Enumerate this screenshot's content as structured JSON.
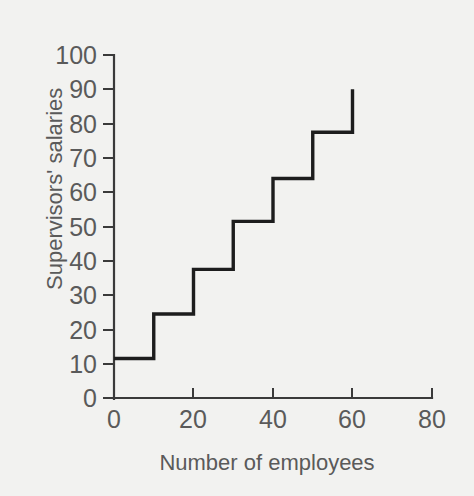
{
  "chart_data": {
    "type": "line",
    "subtype": "step",
    "title": "",
    "xlabel": "Number of employees",
    "ylabel": "Supervisors' salaries",
    "xlim": [
      0,
      80
    ],
    "ylim": [
      0,
      100
    ],
    "xticks": [
      0,
      20,
      40,
      60,
      80
    ],
    "xtick_labels": [
      "0",
      "20",
      "40",
      "60",
      "80"
    ],
    "yticks": [
      0,
      10,
      20,
      30,
      40,
      50,
      60,
      70,
      80,
      90,
      100
    ],
    "ytick_labels": [
      "0",
      "10",
      "20",
      "30",
      "40",
      "50",
      "60",
      "70",
      "80",
      "90",
      "100"
    ],
    "grid": false,
    "legend": null,
    "line_color": "#1d1d1d",
    "background_color": "#f2f2f0",
    "axis_color": "#3a3a3a",
    "text_color": "#5a5a5a",
    "steps": [
      {
        "x_start": 0,
        "x_end": 10,
        "y": 11.5
      },
      {
        "x_start": 10,
        "x_end": 20,
        "y": 24.5
      },
      {
        "x_start": 20,
        "x_end": 30,
        "y": 37.5
      },
      {
        "x_start": 30,
        "x_end": 40,
        "y": 51.5
      },
      {
        "x_start": 40,
        "x_end": 50,
        "y": 64
      },
      {
        "x_start": 50,
        "x_end": 60,
        "y": 77.5
      }
    ],
    "x": [
      0,
      10,
      10,
      20,
      20,
      30,
      30,
      40,
      40,
      50,
      50,
      60,
      60
    ],
    "y": [
      11.5,
      11.5,
      24.5,
      24.5,
      37.5,
      37.5,
      51.5,
      51.5,
      64,
      64,
      77.5,
      77.5,
      90
    ],
    "terminal_point": {
      "x": 60,
      "y": 90
    }
  }
}
